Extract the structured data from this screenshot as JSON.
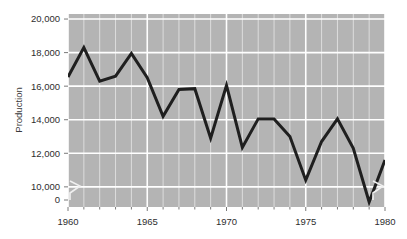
{
  "chart_data": {
    "type": "line",
    "title": "",
    "xlabel": "",
    "ylabel": "Production",
    "x": [
      1960,
      1961,
      1962,
      1963,
      1964,
      1965,
      1966,
      1967,
      1968,
      1969,
      1970,
      1971,
      1972,
      1973,
      1974,
      1975,
      1976,
      1977,
      1978,
      1979,
      1980
    ],
    "values": [
      16550,
      18300,
      16300,
      16600,
      17950,
      16500,
      14200,
      15800,
      15850,
      12900,
      16050,
      12350,
      14050,
      14050,
      13000,
      10400,
      12700,
      14050,
      12300,
      9100,
      11600
    ],
    "series": [
      {
        "name": "Production",
        "values": [
          16550,
          18300,
          16300,
          16600,
          17950,
          16500,
          14200,
          15800,
          15850,
          12900,
          16050,
          12350,
          14050,
          14050,
          13000,
          10400,
          12700,
          14050,
          12300,
          9100,
          11600
        ]
      }
    ],
    "xlim": [
      1960,
      1980
    ],
    "ylim": [
      8800,
      20300
    ],
    "xticks": [
      1960,
      1965,
      1970,
      1975,
      1980
    ],
    "xticklabels": [
      "1960",
      "1965",
      "1970",
      "1975",
      "1980"
    ],
    "yticks": [
      0,
      10000,
      12000,
      14000,
      16000,
      18000,
      20000
    ],
    "yticklabels": [
      "0",
      "10,000",
      "12,000",
      "14,000",
      "16,000",
      "18,000",
      "20,000"
    ],
    "minor_xticks_every": 1,
    "grid": true,
    "grid_color": "#ffffff",
    "plot_background": "#b4b4b4",
    "line_color": "#1f1f1f",
    "line_width": 3,
    "legend": null,
    "axis_break": {
      "present": true,
      "axis": "y",
      "between": [
        0,
        10000
      ],
      "symbol": "zigzag",
      "locations": [
        "left",
        "right"
      ]
    },
    "annotations": []
  },
  "yaxis": {
    "label": "Production",
    "ticks": [
      {
        "label": "20,000",
        "value": 20000
      },
      {
        "label": "18,000",
        "value": 18000
      },
      {
        "label": "16,000",
        "value": 16000
      },
      {
        "label": "14,000",
        "value": 14000
      },
      {
        "label": "12,000",
        "value": 12000
      },
      {
        "label": "10,000",
        "value": 10000
      },
      {
        "label": "0",
        "value": 0
      }
    ]
  },
  "xaxis": {
    "label": "",
    "ticks": [
      {
        "label": "1960",
        "value": 1960
      },
      {
        "label": "1965",
        "value": 1965
      },
      {
        "label": "1970",
        "value": 1970
      },
      {
        "label": "1975",
        "value": 1975
      },
      {
        "label": "1980",
        "value": 1980
      }
    ]
  }
}
